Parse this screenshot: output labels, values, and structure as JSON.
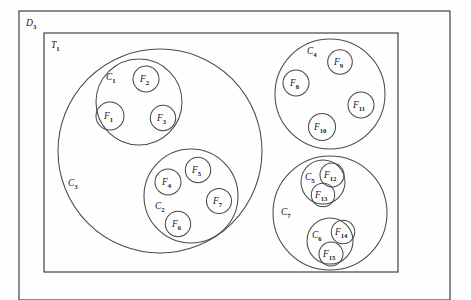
{
  "figure": {
    "canvas": {
      "width": 471,
      "height": 300,
      "background": "#fefefe"
    },
    "stroke_color": "#4a4a4a",
    "label_color": "#1a1a1a"
  },
  "outer_regions": [
    {
      "id": "D3",
      "name": "outer-domain-rect",
      "base": "D",
      "sub": "3",
      "shape": "rect",
      "x": 19,
      "y": 11,
      "width": 431,
      "height": 289,
      "label_x": 26,
      "label_y": 26
    },
    {
      "id": "T1",
      "name": "inner-tree-rect",
      "base": "T",
      "sub": "1",
      "shape": "rect",
      "x": 44,
      "y": 33,
      "width": 354,
      "height": 239,
      "label_x": 51,
      "label_y": 48
    }
  ],
  "cluster_circles": [
    {
      "id": "C3",
      "base": "C",
      "sub": "3",
      "cx": 160,
      "cy": 151,
      "r": 102,
      "label_x": 68,
      "label_y": 186
    },
    {
      "id": "C1",
      "base": "C",
      "sub": "1",
      "cx": 139,
      "cy": 102,
      "r": 43,
      "label_x": 106,
      "label_y": 80
    },
    {
      "id": "C2",
      "base": "C",
      "sub": "2",
      "cx": 191,
      "cy": 196,
      "r": 47,
      "label_x": 155,
      "label_y": 209
    },
    {
      "id": "C4",
      "base": "C",
      "sub": "4",
      "cx": 330,
      "cy": 94,
      "r": 55,
      "label_x": 307,
      "label_y": 54
    },
    {
      "id": "C7",
      "base": "C",
      "sub": "7",
      "cx": 330,
      "cy": 213,
      "r": 57,
      "label_x": 281,
      "label_y": 215
    },
    {
      "id": "C5",
      "base": "C",
      "sub": "5",
      "cx": 323,
      "cy": 182,
      "r": 22,
      "label_x": 305,
      "label_y": 180
    },
    {
      "id": "C6",
      "base": "C",
      "sub": "6",
      "cx": 330,
      "cy": 241,
      "r": 23,
      "label_x": 312,
      "label_y": 238
    }
  ],
  "leaf_circles": [
    {
      "id": "F1",
      "base": "F",
      "sub": "1",
      "cx": 110,
      "cy": 116,
      "r": 14,
      "label_x": 104,
      "label_y": 119
    },
    {
      "id": "F2",
      "base": "F",
      "sub": "2",
      "cx": 146,
      "cy": 79,
      "r": 13,
      "label_x": 140,
      "label_y": 82
    },
    {
      "id": "F3",
      "base": "F",
      "sub": "3",
      "cx": 163,
      "cy": 118,
      "r": 12.7,
      "label_x": 157,
      "label_y": 121
    },
    {
      "id": "F4",
      "base": "F",
      "sub": "4",
      "cx": 168,
      "cy": 182,
      "r": 13,
      "label_x": 162,
      "label_y": 185
    },
    {
      "id": "F5",
      "base": "F",
      "sub": "5",
      "cx": 198,
      "cy": 170,
      "r": 12.7,
      "label_x": 192,
      "label_y": 173
    },
    {
      "id": "F6",
      "base": "F",
      "sub": "6",
      "cx": 178,
      "cy": 224,
      "r": 12.7,
      "label_x": 172,
      "label_y": 227
    },
    {
      "id": "F7",
      "base": "F",
      "sub": "7",
      "cx": 219,
      "cy": 201,
      "r": 12.5,
      "label_x": 213,
      "label_y": 204
    },
    {
      "id": "F8",
      "base": "F",
      "sub": "8",
      "cx": 296,
      "cy": 83,
      "r": 13,
      "label_x": 290,
      "label_y": 86
    },
    {
      "id": "F9",
      "base": "F",
      "sub": "9",
      "cx": 340,
      "cy": 62,
      "r": 12.3,
      "label_x": 334,
      "label_y": 65
    },
    {
      "id": "F10",
      "base": "F",
      "sub": "10",
      "cx": 322,
      "cy": 127,
      "r": 13.5,
      "label_x": 314,
      "label_y": 130
    },
    {
      "id": "F11",
      "base": "F",
      "sub": "11",
      "cx": 361,
      "cy": 105,
      "r": 13,
      "label_x": 353,
      "label_y": 108
    },
    {
      "id": "F12",
      "base": "F",
      "sub": "12",
      "cx": 332,
      "cy": 175,
      "r": 12,
      "label_x": 324,
      "label_y": 178
    },
    {
      "id": "F13",
      "base": "F",
      "sub": "13",
      "cx": 323,
      "cy": 195,
      "r": 11.7,
      "label_x": 315,
      "label_y": 198
    },
    {
      "id": "F14",
      "base": "F",
      "sub": "14",
      "cx": 343,
      "cy": 232,
      "r": 11.7,
      "label_x": 335,
      "label_y": 235
    },
    {
      "id": "F15",
      "base": "F",
      "sub": "15",
      "cx": 331,
      "cy": 254,
      "r": 12,
      "label_x": 323,
      "label_y": 257
    }
  ]
}
